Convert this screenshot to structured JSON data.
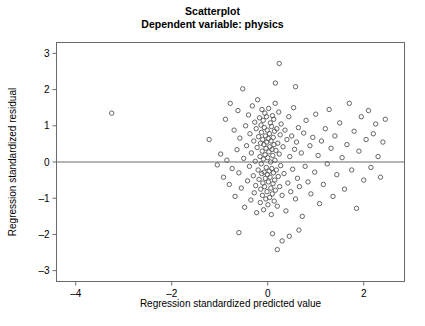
{
  "figure": {
    "title_line_1": "Scatterplot",
    "title_line_2": "Dependent variable: physics",
    "background_color": "#ffffff",
    "frame_color": "#6b6b6b",
    "marker_color": "#555555"
  },
  "chart_data": {
    "type": "scatter",
    "title": "Scatterplot",
    "subtitle": "Dependent variable: physics",
    "xlabel": "Regression standardized predicted value",
    "ylabel": "Regression standardized residual",
    "xlim": [
      -4.4,
      2.85
    ],
    "ylim": [
      -3.3,
      3.3
    ],
    "xticks": [
      -4,
      -2,
      0,
      2
    ],
    "xtick_labels": [
      "–4",
      "–2",
      "0",
      "2"
    ],
    "yticks": [
      -3,
      -2,
      -1,
      0,
      1,
      2,
      3
    ],
    "ytick_labels": [
      "–3",
      "–2",
      "–1",
      "0",
      "1",
      "2",
      "3"
    ],
    "grid": false,
    "legend": null,
    "reference_line_y": 0,
    "marker_style": "open-circle",
    "n_points": 184,
    "points": [
      [
        -3.25,
        1.35
      ],
      [
        -1.22,
        0.62
      ],
      [
        -1.05,
        -0.08
      ],
      [
        -0.98,
        0.22
      ],
      [
        -0.92,
        -0.42
      ],
      [
        -0.88,
        1.18
      ],
      [
        -0.85,
        0.05
      ],
      [
        -0.8,
        -0.62
      ],
      [
        -0.78,
        1.62
      ],
      [
        -0.74,
        -0.18
      ],
      [
        -0.7,
        0.88
      ],
      [
        -0.68,
        -0.95
      ],
      [
        -0.64,
        0.34
      ],
      [
        -0.62,
        1.42
      ],
      [
        -0.6,
        -0.3
      ],
      [
        -0.58,
        0.66
      ],
      [
        -0.55,
        -0.72
      ],
      [
        -0.52,
        2.02
      ],
      [
        -0.5,
        0.1
      ],
      [
        -0.48,
        -1.25
      ],
      [
        -0.46,
        1.0
      ],
      [
        -0.44,
        0.45
      ],
      [
        -0.42,
        -0.52
      ],
      [
        -0.4,
        1.3
      ],
      [
        -0.38,
        -0.12
      ],
      [
        -0.37,
        0.78
      ],
      [
        -0.35,
        -1.05
      ],
      [
        -0.34,
        0.25
      ],
      [
        -0.32,
        1.55
      ],
      [
        -0.3,
        -0.38
      ],
      [
        -0.29,
        0.58
      ],
      [
        -0.28,
        -0.85
      ],
      [
        -0.27,
        1.1
      ],
      [
        -0.26,
        0.02
      ],
      [
        -0.25,
        -0.65
      ],
      [
        -0.24,
        0.92
      ],
      [
        -0.23,
        -1.4
      ],
      [
        -0.22,
        0.4
      ],
      [
        -0.21,
        1.72
      ],
      [
        -0.2,
        -0.22
      ],
      [
        -0.19,
        0.7
      ],
      [
        -0.18,
        -0.48
      ],
      [
        -0.17,
        1.22
      ],
      [
        -0.16,
        0.15
      ],
      [
        -0.155,
        -1.12
      ],
      [
        -0.15,
        0.52
      ],
      [
        -0.145,
        -0.75
      ],
      [
        -0.14,
        1.02
      ],
      [
        -0.135,
        -0.05
      ],
      [
        -0.13,
        0.82
      ],
      [
        -0.125,
        -0.32
      ],
      [
        -0.12,
        1.45
      ],
      [
        -0.115,
        0.3
      ],
      [
        -0.11,
        -0.92
      ],
      [
        -0.105,
        0.62
      ],
      [
        -0.1,
        -0.58
      ],
      [
        -0.095,
        1.15
      ],
      [
        -0.09,
        0.08
      ],
      [
        -0.085,
        -1.32
      ],
      [
        -0.08,
        0.48
      ],
      [
        -0.075,
        -0.28
      ],
      [
        -0.07,
        0.95
      ],
      [
        -0.065,
        -0.68
      ],
      [
        -0.06,
        1.35
      ],
      [
        -0.055,
        0.2
      ],
      [
        -0.05,
        -0.45
      ],
      [
        -0.045,
        0.72
      ],
      [
        -0.04,
        -1.02
      ],
      [
        -0.035,
        0.38
      ],
      [
        -0.03,
        -0.15
      ],
      [
        -0.025,
        1.25
      ],
      [
        -0.02,
        0.55
      ],
      [
        -0.015,
        -0.82
      ],
      [
        -0.01,
        0.88
      ],
      [
        -0.005,
        -0.35
      ],
      [
        0.0,
        0.12
      ],
      [
        0.005,
        -1.18
      ],
      [
        0.01,
        0.65
      ],
      [
        0.015,
        -0.55
      ],
      [
        0.02,
        1.48
      ],
      [
        0.025,
        0.28
      ],
      [
        0.03,
        -0.25
      ],
      [
        0.035,
        0.78
      ],
      [
        0.04,
        -0.98
      ],
      [
        0.045,
        0.42
      ],
      [
        0.05,
        -0.42
      ],
      [
        0.055,
        1.08
      ],
      [
        0.06,
        0.0
      ],
      [
        0.065,
        -0.72
      ],
      [
        0.07,
        0.58
      ],
      [
        0.075,
        -1.45
      ],
      [
        0.08,
        0.98
      ],
      [
        0.085,
        -0.18
      ],
      [
        0.09,
        0.35
      ],
      [
        0.095,
        -0.88
      ],
      [
        0.1,
        1.28
      ],
      [
        0.105,
        0.18
      ],
      [
        0.11,
        -0.6
      ],
      [
        0.115,
        0.68
      ],
      [
        0.12,
        -0.3
      ],
      [
        0.125,
        1.18
      ],
      [
        0.13,
        0.48
      ],
      [
        0.135,
        -1.08
      ],
      [
        0.14,
        0.85
      ],
      [
        0.145,
        -0.5
      ],
      [
        0.15,
        0.05
      ],
      [
        0.155,
        1.62
      ],
      [
        0.16,
        -0.78
      ],
      [
        0.17,
        0.32
      ],
      [
        0.18,
        -0.22
      ],
      [
        0.19,
        0.92
      ],
      [
        0.2,
        -1.22
      ],
      [
        0.21,
        0.52
      ],
      [
        0.22,
        -0.4
      ],
      [
        0.23,
        1.38
      ],
      [
        0.24,
        0.22
      ],
      [
        0.25,
        -0.68
      ],
      [
        0.26,
        0.75
      ],
      [
        0.27,
        -0.1
      ],
      [
        0.28,
        1.05
      ],
      [
        0.3,
        -0.92
      ],
      [
        0.32,
        0.42
      ],
      [
        0.34,
        -0.32
      ],
      [
        0.36,
        0.88
      ],
      [
        0.38,
        -1.35
      ],
      [
        0.4,
        0.62
      ],
      [
        0.42,
        -0.58
      ],
      [
        0.44,
        1.25
      ],
      [
        0.46,
        0.15
      ],
      [
        0.48,
        -0.82
      ],
      [
        0.5,
        0.72
      ],
      [
        0.52,
        -0.2
      ],
      [
        0.54,
        1.5
      ],
      [
        0.56,
        0.35
      ],
      [
        0.58,
        -1.02
      ],
      [
        0.6,
        0.55
      ],
      [
        0.62,
        -0.45
      ],
      [
        0.64,
        0.95
      ],
      [
        0.66,
        -0.68
      ],
      [
        0.7,
        0.25
      ],
      [
        0.72,
        -1.5
      ],
      [
        0.75,
        0.8
      ],
      [
        0.78,
        -0.12
      ],
      [
        0.8,
        1.15
      ],
      [
        0.84,
        -0.55
      ],
      [
        0.88,
        0.45
      ],
      [
        0.9,
        -0.88
      ],
      [
        0.94,
        0.68
      ],
      [
        0.98,
        -0.28
      ],
      [
        1.0,
        1.32
      ],
      [
        1.05,
        0.18
      ],
      [
        1.08,
        -1.15
      ],
      [
        1.12,
        0.58
      ],
      [
        1.16,
        -0.62
      ],
      [
        1.2,
        0.92
      ],
      [
        1.24,
        -0.05
      ],
      [
        1.28,
        1.45
      ],
      [
        1.32,
        0.38
      ],
      [
        1.36,
        -0.95
      ],
      [
        1.4,
        0.72
      ],
      [
        1.44,
        -0.35
      ],
      [
        1.5,
        1.08
      ],
      [
        1.55,
        0.12
      ],
      [
        1.6,
        -0.75
      ],
      [
        1.65,
        0.48
      ],
      [
        1.7,
        1.62
      ],
      [
        1.75,
        -0.22
      ],
      [
        1.8,
        0.85
      ],
      [
        1.85,
        -1.28
      ],
      [
        1.9,
        0.3
      ],
      [
        1.95,
        1.25
      ],
      [
        2.0,
        -0.5
      ],
      [
        2.05,
        0.62
      ],
      [
        2.1,
        1.42
      ],
      [
        2.15,
        -0.15
      ],
      [
        2.2,
        0.78
      ],
      [
        2.25,
        1.05
      ],
      [
        2.3,
        0.15
      ],
      [
        2.35,
        -0.42
      ],
      [
        2.4,
        0.55
      ],
      [
        2.45,
        1.18
      ],
      [
        0.45,
        -2.05
      ],
      [
        0.2,
        -2.42
      ],
      [
        0.3,
        -2.18
      ],
      [
        -0.6,
        -1.95
      ],
      [
        0.65,
        -1.88
      ],
      [
        0.1,
        -1.98
      ],
      [
        0.24,
        2.72
      ],
      [
        0.58,
        2.08
      ],
      [
        0.16,
        2.18
      ]
    ]
  }
}
